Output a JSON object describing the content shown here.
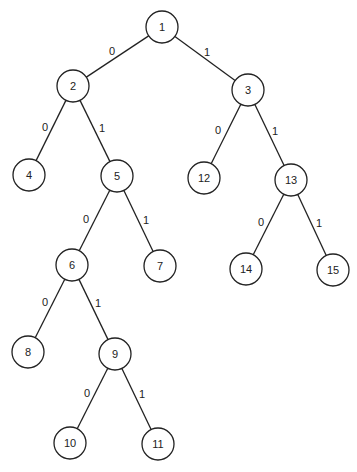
{
  "diagram": {
    "type": "binary-tree",
    "node_radius": 16,
    "nodes": [
      {
        "id": "1",
        "label": "1",
        "x": 162,
        "y": 27
      },
      {
        "id": "2",
        "label": "2",
        "x": 73,
        "y": 86
      },
      {
        "id": "3",
        "label": "3",
        "x": 248,
        "y": 90
      },
      {
        "id": "4",
        "label": "4",
        "x": 29,
        "y": 175
      },
      {
        "id": "5",
        "label": "5",
        "x": 117,
        "y": 176
      },
      {
        "id": "12",
        "label": "12",
        "x": 204,
        "y": 178
      },
      {
        "id": "13",
        "label": "13",
        "x": 291,
        "y": 180
      },
      {
        "id": "6",
        "label": "6",
        "x": 72,
        "y": 265
      },
      {
        "id": "7",
        "label": "7",
        "x": 160,
        "y": 266
      },
      {
        "id": "14",
        "label": "14",
        "x": 246,
        "y": 269
      },
      {
        "id": "15",
        "label": "15",
        "x": 333,
        "y": 270
      },
      {
        "id": "8",
        "label": "8",
        "x": 28,
        "y": 352
      },
      {
        "id": "9",
        "label": "9",
        "x": 115,
        "y": 354
      },
      {
        "id": "10",
        "label": "10",
        "x": 70,
        "y": 443
      },
      {
        "id": "11",
        "label": "11",
        "x": 158,
        "y": 444
      }
    ],
    "edges": [
      {
        "from": "1",
        "to": "2",
        "label": "0",
        "lx": 112,
        "ly": 51
      },
      {
        "from": "1",
        "to": "3",
        "label": "1",
        "lx": 207,
        "ly": 52
      },
      {
        "from": "2",
        "to": "4",
        "label": "0",
        "lx": 45,
        "ly": 127
      },
      {
        "from": "2",
        "to": "5",
        "label": "1",
        "lx": 102,
        "ly": 128
      },
      {
        "from": "3",
        "to": "12",
        "label": "0",
        "lx": 218,
        "ly": 130
      },
      {
        "from": "3",
        "to": "13",
        "label": "1",
        "lx": 275,
        "ly": 131
      },
      {
        "from": "5",
        "to": "6",
        "label": "0",
        "lx": 86,
        "ly": 219
      },
      {
        "from": "5",
        "to": "7",
        "label": "1",
        "lx": 146,
        "ly": 220
      },
      {
        "from": "13",
        "to": "14",
        "label": "0",
        "lx": 261,
        "ly": 222
      },
      {
        "from": "13",
        "to": "15",
        "label": "1",
        "lx": 319,
        "ly": 223
      },
      {
        "from": "6",
        "to": "8",
        "label": "0",
        "lx": 45,
        "ly": 302
      },
      {
        "from": "6",
        "to": "9",
        "label": "1",
        "lx": 98,
        "ly": 303
      },
      {
        "from": "9",
        "to": "10",
        "label": "0",
        "lx": 87,
        "ly": 393
      },
      {
        "from": "9",
        "to": "11",
        "label": "1",
        "lx": 142,
        "ly": 394
      }
    ]
  }
}
